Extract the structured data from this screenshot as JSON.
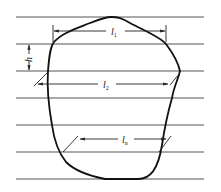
{
  "diagram": {
    "labels": {
      "l1": "l",
      "l1_sub": "1",
      "l2": "l",
      "l2_sub": "2",
      "ln": "l",
      "ln_sub": "n",
      "h": "h"
    },
    "horizontal_line_count": 7,
    "colors": {
      "lines": "#555555",
      "outline": "#111111",
      "background": "#ffffff"
    }
  }
}
